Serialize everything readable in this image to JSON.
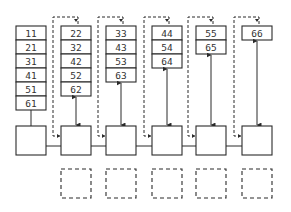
{
  "diagram": {
    "columns": [
      {
        "cells": [
          "11",
          "21",
          "31",
          "41",
          "51",
          "61"
        ]
      },
      {
        "cells": [
          "22",
          "32",
          "42",
          "52",
          "62"
        ]
      },
      {
        "cells": [
          "33",
          "43",
          "53",
          "63"
        ]
      },
      {
        "cells": [
          "44",
          "54",
          "64"
        ]
      },
      {
        "cells": [
          "55",
          "65"
        ]
      },
      {
        "cells": [
          "66"
        ]
      }
    ],
    "processing_boxes": 6,
    "dashed_boxes": 5,
    "colors": {
      "stroke": "#2a2a2a",
      "background": "#ffffff",
      "text": "#333333"
    }
  }
}
